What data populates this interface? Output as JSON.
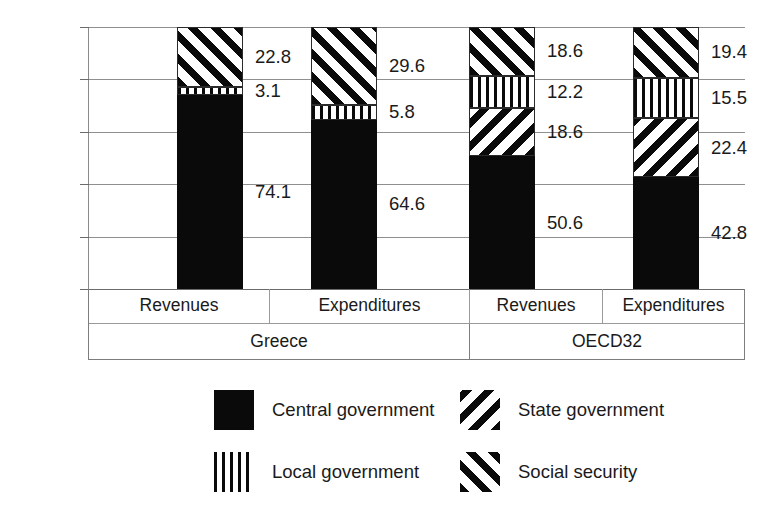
{
  "chart_data": {
    "type": "bar",
    "stacked": true,
    "stack_total": 100,
    "title": "",
    "subtitle": "",
    "xlabel": "",
    "ylabel": "",
    "ylim": [
      0,
      100
    ],
    "ytick_labels": [
      "100%",
      "80%",
      "60%",
      "40%",
      "20%",
      "0%"
    ],
    "ytick_values": [
      100,
      80,
      60,
      40,
      20,
      0
    ],
    "grid": true,
    "legend_position": "bottom",
    "groups": [
      {
        "name": "Greece",
        "categories": [
          "Revenues",
          "Expenditures"
        ]
      },
      {
        "name": "OECD32",
        "categories": [
          "Revenues",
          "Expenditures"
        ]
      }
    ],
    "categories": [
      "Revenues",
      "Expenditures",
      "Revenues",
      "Expenditures"
    ],
    "series": [
      {
        "name": "Central government",
        "pattern": "solid-black",
        "values": [
          74.1,
          64.6,
          50.6,
          42.8
        ]
      },
      {
        "name": "State government",
        "pattern": "backslash-hatch",
        "values": [
          0,
          0,
          18.6,
          22.4
        ]
      },
      {
        "name": "Local government",
        "pattern": "vertical-stripe",
        "values": [
          3.1,
          5.8,
          12.2,
          15.5
        ]
      },
      {
        "name": "Social security",
        "pattern": "forwardslash-hatch",
        "values": [
          22.8,
          29.6,
          18.6,
          19.4
        ]
      }
    ],
    "bars": [
      {
        "group": "Greece",
        "category": "Revenues",
        "segments": [
          {
            "series": "Central government",
            "value": 74.1,
            "label": "74.1"
          },
          {
            "series": "Local government",
            "value": 3.1,
            "label": "3.1"
          },
          {
            "series": "Social security",
            "value": 22.8,
            "label": "22.8"
          }
        ]
      },
      {
        "group": "Greece",
        "category": "Expenditures",
        "segments": [
          {
            "series": "Central government",
            "value": 64.6,
            "label": "64.6"
          },
          {
            "series": "Local government",
            "value": 5.8,
            "label": "5.8"
          },
          {
            "series": "Social security",
            "value": 29.6,
            "label": "29.6"
          }
        ]
      },
      {
        "group": "OECD32",
        "category": "Revenues",
        "segments": [
          {
            "series": "Central government",
            "value": 50.6,
            "label": "50.6"
          },
          {
            "series": "State government",
            "value": 18.6,
            "label": "18.6"
          },
          {
            "series": "Local government",
            "value": 12.2,
            "label": "12.2"
          },
          {
            "series": "Social security",
            "value": 18.6,
            "label": "18.6"
          }
        ]
      },
      {
        "group": "OECD32",
        "category": "Expenditures",
        "segments": [
          {
            "series": "Central government",
            "value": 42.8,
            "label": "42.8"
          },
          {
            "series": "State government",
            "value": 22.4,
            "label": "22.4"
          },
          {
            "series": "Local government",
            "value": 15.5,
            "label": "15.5"
          },
          {
            "series": "Social security",
            "value": 19.4,
            "label": "19.4"
          }
        ]
      }
    ]
  },
  "axis": {
    "y": {
      "ticks": [
        {
          "label": "100%",
          "value": 100
        },
        {
          "label": "80%",
          "value": 80
        },
        {
          "label": "60%",
          "value": 60
        },
        {
          "label": "40%",
          "value": 40
        },
        {
          "label": "20%",
          "value": 20
        },
        {
          "label": "0%",
          "value": 0
        }
      ]
    }
  },
  "categories_row": {
    "sub": [
      "Revenues",
      "Expenditures",
      "Revenues",
      "Expenditures"
    ],
    "groups": [
      "Greece",
      "OECD32"
    ]
  },
  "legend": {
    "items": [
      {
        "label": "Central government",
        "pattern": "solid-black"
      },
      {
        "label": "State government",
        "pattern": "backslash-hatch"
      },
      {
        "label": "Local government",
        "pattern": "vertical-stripe"
      },
      {
        "label": "Social security",
        "pattern": "forwardslash-hatch"
      }
    ]
  },
  "colors": {
    "ink": "#0a0a0a",
    "background": "#ffffff",
    "gridline": "#8f8f8f",
    "axis": "#6b6b6b",
    "text": "#1a1a1a"
  }
}
